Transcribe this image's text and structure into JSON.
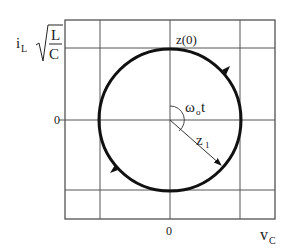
{
  "diagram": {
    "type": "state-plane phase portrait",
    "y_axis": {
      "label_main": "i",
      "label_sub": "L",
      "sqrt_numerator": "L",
      "sqrt_denominator": "C",
      "zero_label": "0"
    },
    "x_axis": {
      "label_main": "v",
      "label_sub": "C",
      "zero_label": "0"
    },
    "annotations": {
      "initial_point": "z(0)",
      "angle_main": "ω",
      "angle_sub": "o",
      "angle_suffix": "t",
      "radius_main": "z",
      "radius_sub": "1"
    },
    "trajectory": {
      "shape": "circle",
      "direction": "clockwise",
      "center": [
        0,
        0
      ]
    },
    "colors": {
      "trajectory": "#111111",
      "grid": "#555555",
      "background": "#ffffff"
    }
  }
}
